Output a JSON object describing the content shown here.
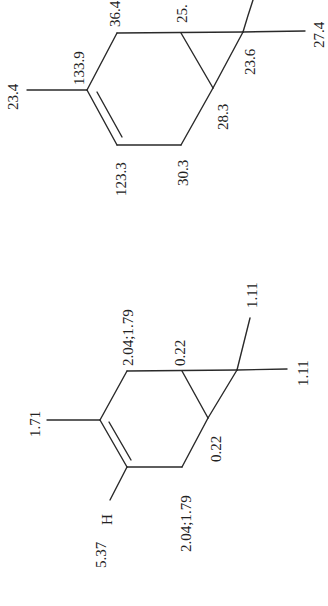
{
  "figure": {
    "carbon13": {
      "methyl_on_c3": "23.4",
      "c3": "133.9",
      "c4": "123.3",
      "c5": "30.3",
      "c6": "28.3",
      "c7": "23.6",
      "c1": "25.",
      "c2": "36.4",
      "gem_methyl_a": "27.4"
    },
    "proton1": {
      "methyl_on_c3": "1.71",
      "vinyl_h_label": "H",
      "vinyl_h": "5.37",
      "ch2_top": "2.04;1.79",
      "ch2_bottom": "2.04;1.79",
      "cyclopropane_h_top": "0.22",
      "cyclopropane_h_bottom": "0.22",
      "gem_methyl_a": "1.11",
      "gem_methyl_b": "1.11"
    }
  }
}
